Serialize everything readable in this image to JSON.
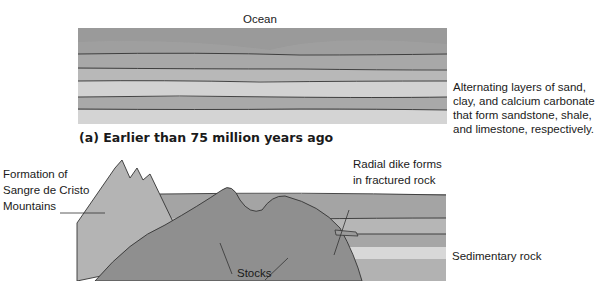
{
  "panel_a": {
    "top_label": "Ocean",
    "side_label": [
      "Alternating layers of sand,",
      "clay, and calcium carbonate",
      "that form sandstone, shale,",
      "and limestone, respectively."
    ],
    "caption": "(a) Earlier than 75 million years ago"
  },
  "panel_b": {
    "mountains_label": [
      "Formation of",
      "Sangre de Cristo",
      "Mountains"
    ],
    "dike_label": [
      "Radial dike forms",
      "in fractured rock"
    ],
    "stocks_label": "Stocks",
    "sedimentary_label": "Sedimentary rock"
  },
  "colors": {
    "ocean": "#9a9a9a",
    "layer_dark": "#a6a6a6",
    "layer_mid": "#b8b8b8",
    "layer_light": "#d4d4d4",
    "stock": "#8e8e8e",
    "mountain": "#b0b0b0",
    "line": "#333333"
  }
}
